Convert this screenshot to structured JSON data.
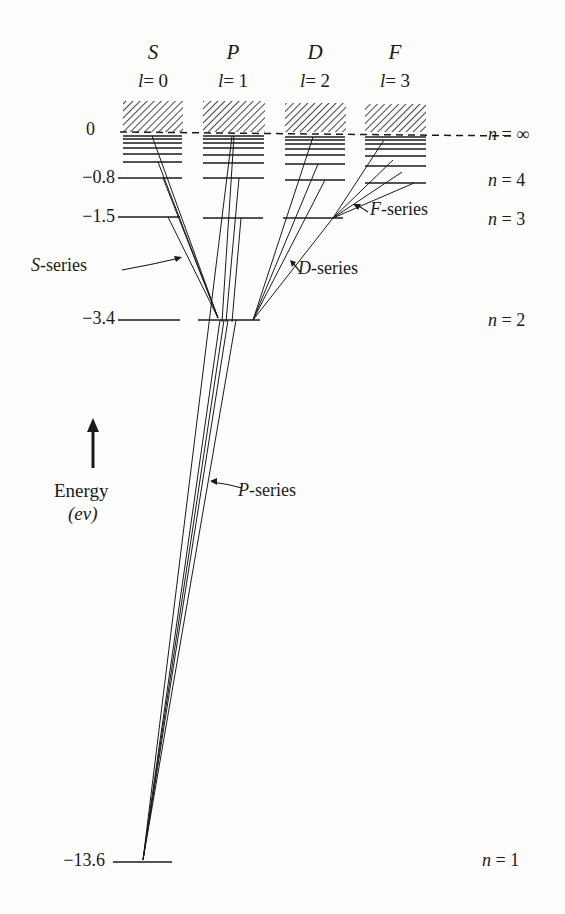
{
  "columns": [
    {
      "letter": "S",
      "l_label": "l",
      "l_value": "= 0"
    },
    {
      "letter": "P",
      "l_label": "l",
      "l_value": "= 1"
    },
    {
      "letter": "D",
      "l_label": "l",
      "l_value": "= 2"
    },
    {
      "letter": "F",
      "l_label": "l",
      "l_value": "= 3"
    }
  ],
  "energy_axis": {
    "ticks": [
      "0",
      "−0.8",
      "−1.5",
      "−3.4",
      "−13.6"
    ],
    "label_line1": "Energy",
    "label_line2": "(ev)",
    "arrow": "up-arrow-icon"
  },
  "quantum_numbers": [
    {
      "n": "n",
      "value": "= ∞"
    },
    {
      "n": "n",
      "value": "= 4"
    },
    {
      "n": "n",
      "value": "= 3"
    },
    {
      "n": "n",
      "value": "= 2"
    },
    {
      "n": "n",
      "value": "= 1"
    }
  ],
  "series_labels": {
    "s": {
      "letter": "S",
      "suffix": "-series"
    },
    "p": {
      "letter": "P",
      "suffix": "-series"
    },
    "d": {
      "letter": "D",
      "suffix": "-series"
    },
    "f": {
      "letter": "F",
      "suffix": "-series"
    }
  },
  "colors": {
    "ink": "#1a1a1a",
    "paper": "#fdfdfb"
  }
}
